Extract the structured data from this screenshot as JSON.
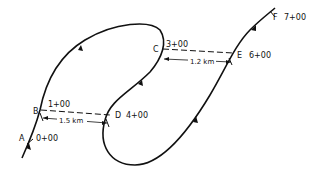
{
  "diagram": {
    "title": "",
    "stations": [
      {
        "point": "A",
        "station": "0+00"
      },
      {
        "point": "B",
        "station": "1+00"
      },
      {
        "point": "C",
        "station": "3+00"
      },
      {
        "point": "D",
        "station": "4+00"
      },
      {
        "point": "E",
        "station": "6+00"
      },
      {
        "point": "F",
        "station": "7+00"
      }
    ],
    "dimensions": [
      {
        "from": "B",
        "to": "D",
        "label": "1.5 km"
      },
      {
        "from": "C",
        "to": "E",
        "label": "1.2 km"
      }
    ],
    "colors": {
      "line": "#111111",
      "background": "#ffffff"
    }
  }
}
